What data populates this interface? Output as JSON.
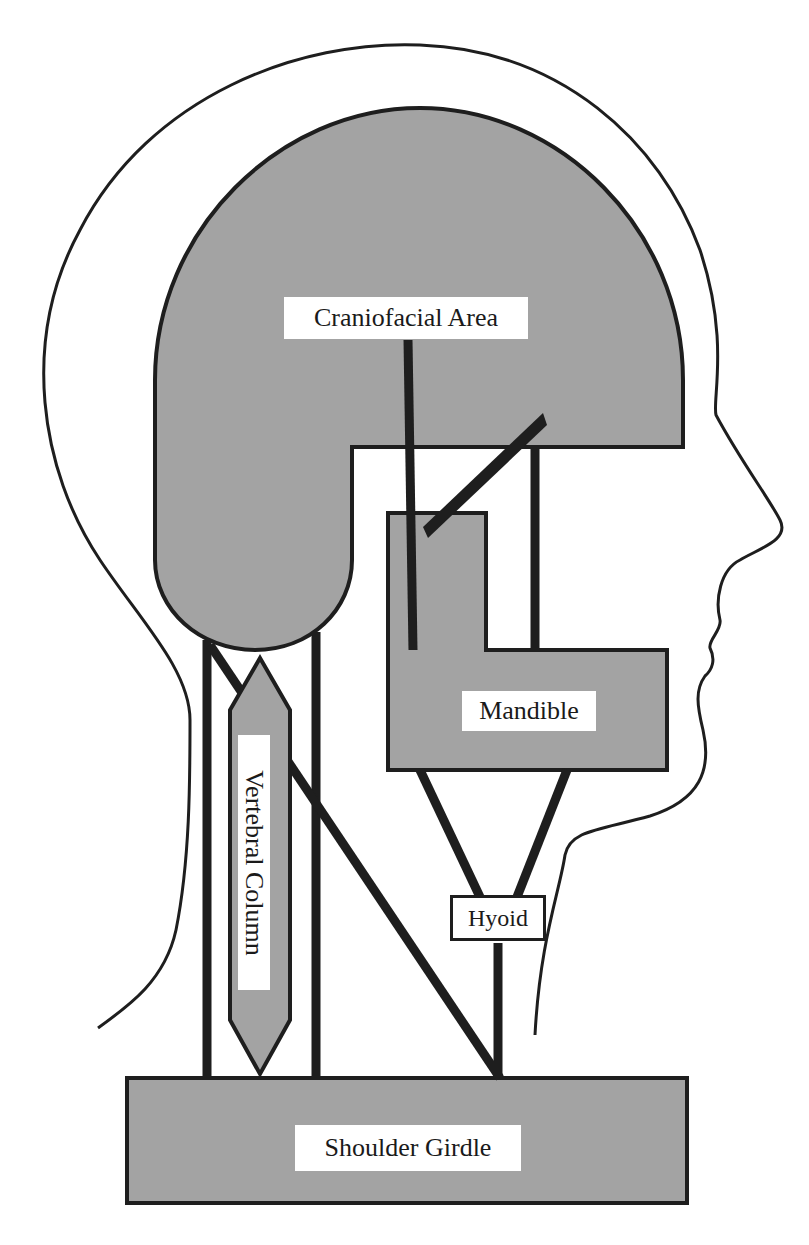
{
  "figure": {
    "colors": {
      "fill_gray": "#a3a3a3",
      "stroke": "#1e1e1e",
      "background": "#ffffff",
      "label_background": "#ffffff"
    },
    "labels": {
      "craniofacial": "Craniofacial Area",
      "mandible": "Mandible",
      "vertebral_column": "Vertebral Column",
      "hyoid": "Hyoid",
      "shoulder_girdle": "Shoulder Girdle"
    }
  }
}
